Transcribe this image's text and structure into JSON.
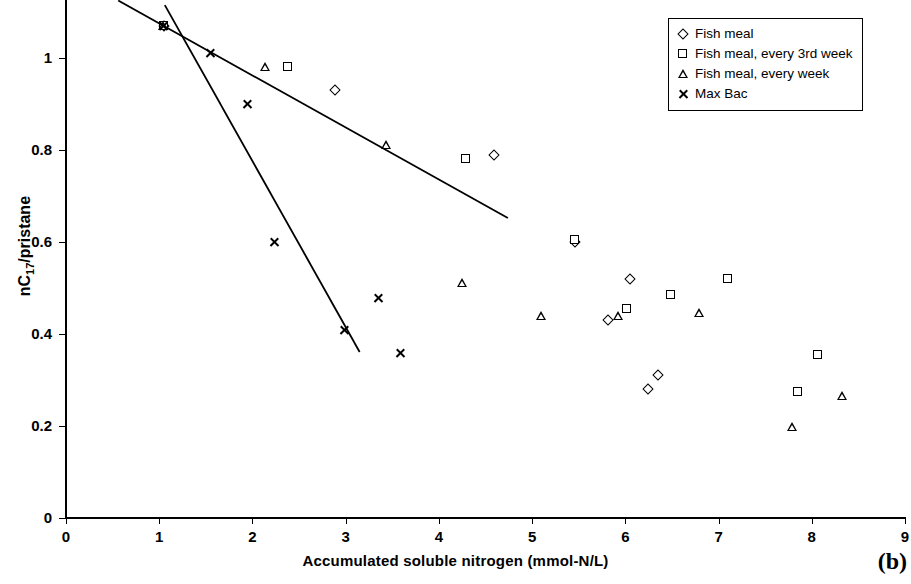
{
  "panel": {
    "label": "(b)"
  },
  "chart_data": {
    "type": "scatter",
    "title": "",
    "xlabel": "Accumulated soluble nitrogen (mmol-N/L)",
    "ylabel": "nC17/pristane",
    "ylabel_base": "nC",
    "ylabel_sub": "17",
    "ylabel_rest": "/pristane",
    "xlim": [
      0,
      9
    ],
    "ylim": [
      0,
      1.12
    ],
    "xticks": [
      0,
      1,
      2,
      3,
      4,
      5,
      6,
      7,
      8,
      9
    ],
    "xtick_labels": [
      "0",
      "1",
      "2",
      "3",
      "4",
      "5",
      "6",
      "7",
      "8",
      "9"
    ],
    "yticks": [
      0,
      0.2,
      0.4,
      0.6,
      0.8,
      1
    ],
    "ytick_labels": [
      "0",
      "0.2",
      "0.4",
      "0.6",
      "0.8",
      "1"
    ],
    "grid": false,
    "legend_position": "top-right",
    "series": [
      {
        "name": "Fish meal",
        "marker": "diamond",
        "points": [
          [
            1.05,
            1.07
          ],
          [
            2.89,
            0.93
          ],
          [
            4.59,
            0.79
          ],
          [
            5.46,
            0.6
          ],
          [
            6.05,
            0.52
          ],
          [
            5.81,
            0.43
          ],
          [
            6.35,
            0.31
          ],
          [
            6.24,
            0.28
          ]
        ]
      },
      {
        "name": "Fish meal, every 3rd week",
        "marker": "square",
        "points": [
          [
            1.05,
            1.07
          ],
          [
            2.38,
            0.98
          ],
          [
            4.29,
            0.78
          ],
          [
            5.46,
            0.605
          ],
          [
            6.02,
            0.455
          ],
          [
            6.49,
            0.485
          ],
          [
            7.1,
            0.52
          ],
          [
            8.07,
            0.355
          ],
          [
            7.85,
            0.275
          ]
        ]
      },
      {
        "name": "Fish meal, every week",
        "marker": "triangle",
        "points": [
          [
            1.05,
            1.07
          ],
          [
            2.14,
            0.98
          ],
          [
            3.44,
            0.81
          ],
          [
            4.25,
            0.51
          ],
          [
            5.1,
            0.44
          ],
          [
            5.93,
            0.44
          ],
          [
            6.8,
            0.445
          ],
          [
            8.33,
            0.265
          ],
          [
            7.79,
            0.197
          ]
        ]
      },
      {
        "name": "Max Bac",
        "marker": "cross",
        "points": [
          [
            1.05,
            1.07
          ],
          [
            1.55,
            1.01
          ],
          [
            1.95,
            0.9
          ],
          [
            2.24,
            0.6
          ],
          [
            3.35,
            0.478
          ],
          [
            2.99,
            0.408
          ],
          [
            3.59,
            0.358
          ]
        ]
      }
    ],
    "trend_lines": [
      {
        "name": "upper-regression",
        "x1": 0.56,
        "y1": 1.125,
        "x2": 4.74,
        "y2": 0.652
      },
      {
        "name": "lower-regression",
        "x1": 1.06,
        "y1": 1.115,
        "x2": 3.15,
        "y2": 0.361
      }
    ]
  },
  "legend": {
    "entries": [
      {
        "label": "Fish meal",
        "marker": "diamond"
      },
      {
        "label": "Fish meal, every 3rd week",
        "marker": "square"
      },
      {
        "label": "Fish meal, every week",
        "marker": "triangle"
      },
      {
        "label": "Max Bac",
        "marker": "cross"
      }
    ]
  }
}
